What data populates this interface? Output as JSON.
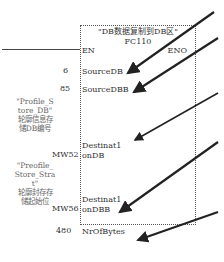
{
  "block": {
    "title": "\"DB数据复制到DB区\"",
    "name": "FC110",
    "en": "EN",
    "eno": "ENO"
  },
  "pins": [
    {
      "value": "6",
      "label": "SourceDB"
    },
    {
      "value": "85",
      "label": "SourceDBB"
    },
    {
      "value": "MW52",
      "label": "Destinat1",
      "label2": "onDB"
    },
    {
      "value": "MW56",
      "label": "Destinat1",
      "label2": "onDBB"
    },
    {
      "value": "480",
      "label": "NrOfBytes"
    }
  ],
  "notes": [
    {
      "line1": "\"Profile_S",
      "line2": "tore_DB\"",
      "line3": "轮廓信息存",
      "line4": "储DB编号"
    },
    {
      "line1": "\"Preofile_",
      "line2": "Store_Stra",
      "line3": "t\"",
      "line4": "轮廓封存存",
      "line5": "储起始位"
    }
  ]
}
